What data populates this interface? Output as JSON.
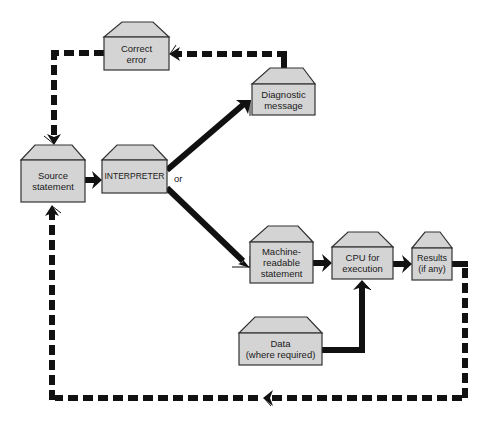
{
  "diagram": {
    "type": "flowchart",
    "title": "",
    "nodes": [
      {
        "id": "correct_error",
        "label": "Correct\nerror"
      },
      {
        "id": "diagnostic_message",
        "label": "Diagnostic\nmessage"
      },
      {
        "id": "source_statement",
        "label": "Source\nstatement"
      },
      {
        "id": "interpreter",
        "label": "INTERPRETER"
      },
      {
        "id": "machine_readable",
        "label": "Machine-\nreadable\nstatement"
      },
      {
        "id": "cpu",
        "label": "CPU for\nexecution"
      },
      {
        "id": "results",
        "label": "Results\n(if any)"
      },
      {
        "id": "data",
        "label": "Data\n(where required)"
      }
    ],
    "branch_label": "or",
    "edges": [
      {
        "from": "source_statement",
        "to": "interpreter",
        "style": "solid"
      },
      {
        "from": "interpreter",
        "to": "diagnostic_message",
        "style": "solid"
      },
      {
        "from": "interpreter",
        "to": "machine_readable",
        "style": "solid"
      },
      {
        "from": "diagnostic_message",
        "to": "correct_error",
        "style": "dashed"
      },
      {
        "from": "correct_error",
        "to": "source_statement",
        "style": "dashed"
      },
      {
        "from": "machine_readable",
        "to": "cpu",
        "style": "solid"
      },
      {
        "from": "data",
        "to": "cpu",
        "style": "solid"
      },
      {
        "from": "cpu",
        "to": "results",
        "style": "solid"
      },
      {
        "from": "results",
        "to": "source_statement",
        "style": "dashed"
      }
    ],
    "colors": {
      "box_fill": "#d4d4d4",
      "box_stroke": "#333333",
      "line": "#111111",
      "background": "#ffffff"
    }
  }
}
